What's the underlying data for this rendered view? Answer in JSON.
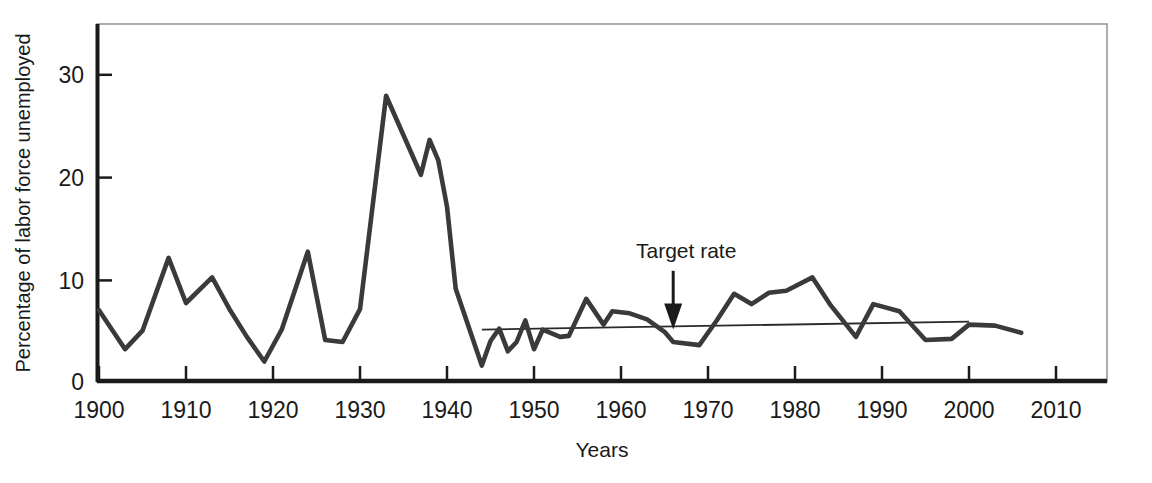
{
  "chart_data": {
    "type": "line",
    "title": "",
    "xlabel": "Years",
    "ylabel": "Percentage of labor force unemployed",
    "xlim": [
      1900,
      2010
    ],
    "ylim": [
      0,
      34.8
    ],
    "grid": false,
    "legend_position": "none",
    "xticks": [
      "1900",
      "1910",
      "1920",
      "1930",
      "1940",
      "1950",
      "1960",
      "1970",
      "1980",
      "1990",
      "2000",
      "2010"
    ],
    "yticks": [
      "0",
      "10",
      "20",
      "30"
    ],
    "series": [
      {
        "name": "Unemployment rate",
        "color": "#3a3a3a",
        "x": [
          1900,
          1903,
          1905,
          1908,
          1910,
          1913,
          1915,
          1917,
          1919,
          1921,
          1924,
          1926,
          1928,
          1930,
          1933,
          1937,
          1938,
          1939,
          1940,
          1941,
          1944,
          1945,
          1946,
          1947,
          1948,
          1949,
          1950,
          1951,
          1953,
          1954,
          1956,
          1958,
          1959,
          1961,
          1963,
          1965,
          1966,
          1969,
          1971,
          1973,
          1975,
          1977,
          1979,
          1982,
          1984,
          1987,
          1989,
          1992,
          1995,
          1998,
          2000,
          2003,
          2006
        ],
        "y": [
          6.9,
          3.1,
          4.9,
          12.0,
          7.6,
          10.1,
          7.0,
          4.3,
          1.9,
          5.0,
          12.6,
          4.0,
          3.8,
          7.0,
          27.8,
          20.1,
          23.5,
          21.5,
          17.0,
          9.0,
          1.5,
          3.9,
          5.1,
          2.9,
          3.8,
          5.9,
          3.1,
          5.0,
          4.3,
          4.4,
          8.0,
          5.5,
          6.8,
          6.6,
          6.0,
          4.8,
          3.8,
          3.5,
          5.9,
          8.5,
          7.5,
          8.6,
          8.8,
          10.1,
          7.5,
          4.3,
          7.5,
          6.8,
          4.0,
          4.1,
          5.5,
          5.4,
          4.7
        ]
      },
      {
        "name": "Target rate trend line",
        "color": "#2a2a2a",
        "x": [
          1944,
          2000
        ],
        "y": [
          5.4,
          5.4
        ]
      }
    ],
    "annotations": [
      {
        "text": "Target rate",
        "x": 1966,
        "y": 12.5,
        "arrow_to_x": 1966,
        "arrow_to_y": 5.4
      }
    ]
  },
  "figure": {
    "frame_color": "#1a1a1a",
    "background": "#ffffff",
    "axis_color": "#1a1a1a"
  }
}
